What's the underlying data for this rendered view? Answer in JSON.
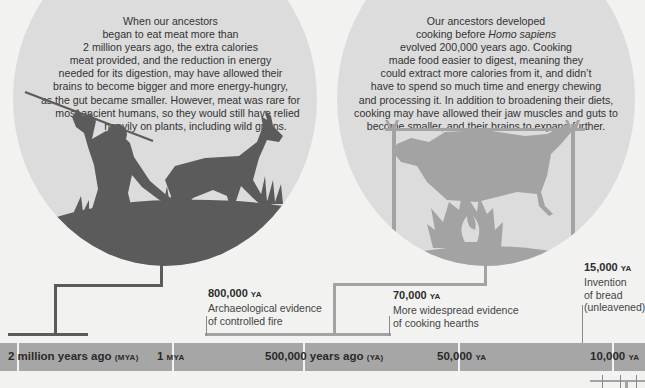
{
  "circles": {
    "left": {
      "lines": [
        "When our ancestors",
        "began to eat meat more than",
        "2 million years ago, the extra calories",
        "meat provided, and the reduction in energy",
        "needed for its digestion, may have allowed their",
        "brains to become bigger and more energy-hungry,",
        "as the gut became smaller. However, meat was rare for",
        "most ancient humans, so they would still have relied",
        "heavily on plants, including wild grains."
      ],
      "illustration": "hunter-with-spear-chasing-antelope-silhouette"
    },
    "right": {
      "line1": "Our ancestors developed",
      "line2_pre": "cooking before ",
      "line2_em": "Homo sapiens",
      "lines_rest": [
        "evolved 200,000 years ago. Cooking",
        "made food easier to digest, meaning they",
        "could extract more calories from it, and didn’t",
        "have to spend so much time and energy chewing",
        "and processing it. In addition to broadening their diets,",
        "cooking may have allowed their jaw muscles and guts to",
        "become smaller, and their brains to expand further."
      ],
      "illustration": "animal-roasting-on-spit-over-fire-silhouette"
    }
  },
  "events": [
    {
      "year": "800,000",
      "unit": "YA",
      "desc": [
        "Archaeological evidence",
        "of controlled fire"
      ]
    },
    {
      "year": "70,000",
      "unit": "YA",
      "desc": [
        "More widespread evidence",
        "of cooking hearths"
      ]
    },
    {
      "year": "15,000",
      "unit": "YA",
      "desc": [
        "Invention",
        "of bread",
        "(unleavened)"
      ]
    }
  ],
  "timeline": {
    "ticks": [
      {
        "main": "2 million years ago ",
        "unit": "(MYA)"
      },
      {
        "main": "1 ",
        "unit": "MYA"
      },
      {
        "main": "500,000 years ago ",
        "unit": "(YA)"
      },
      {
        "main": "50,000 ",
        "unit": "YA"
      },
      {
        "main": "10,000 ",
        "unit": "YA"
      }
    ]
  },
  "colors": {
    "background": "#f2f2f1",
    "circle_fill": "#dcdcdc",
    "silhouette_dark": "#5b5b5b",
    "silhouette_light": "#a3a3a3",
    "timeline_bar": "#a6a6a6"
  }
}
